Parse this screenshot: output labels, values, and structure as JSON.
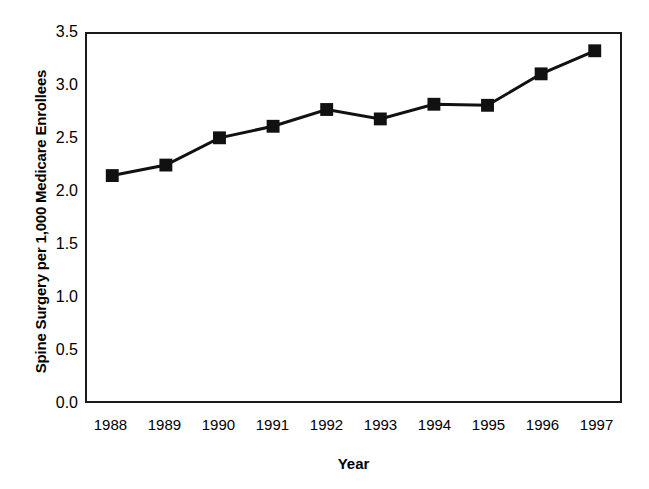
{
  "chart_data": {
    "type": "line",
    "title": "",
    "subtitle": "",
    "xlabel": "Year",
    "ylabel": "Spine Surgery per 1,000 Medicare Enrollees",
    "categories": [
      "1988",
      "1989",
      "1990",
      "1991",
      "1992",
      "1993",
      "1994",
      "1995",
      "1996",
      "1997"
    ],
    "x": [
      1988,
      1989,
      1990,
      1991,
      1992,
      1993,
      1994,
      1995,
      1996,
      1997
    ],
    "values": [
      2.15,
      2.25,
      2.51,
      2.62,
      2.78,
      2.69,
      2.83,
      2.82,
      3.12,
      3.34
    ],
    "series": [
      {
        "name": "Spine Surgery Rate",
        "values": [
          2.15,
          2.25,
          2.51,
          2.62,
          2.78,
          2.69,
          2.83,
          2.82,
          3.12,
          3.34
        ]
      }
    ],
    "ylim": [
      0.0,
      3.5
    ],
    "xlim": [
      1987.5,
      1997.5
    ],
    "y_ticks": [
      "0.0",
      "0.5",
      "1.0",
      "1.5",
      "2.0",
      "2.5",
      "3.0",
      "3.5"
    ],
    "y_tick_values": [
      0.0,
      0.5,
      1.0,
      1.5,
      2.0,
      2.5,
      3.0,
      3.5
    ],
    "x_ticks": [
      "1988",
      "1989",
      "1990",
      "1991",
      "1992",
      "1993",
      "1994",
      "1995",
      "1996",
      "1997"
    ],
    "grid": false,
    "legend": false,
    "legend_position": "none",
    "marker": "square",
    "line_color": "#111111",
    "marker_color": "#111111",
    "background_color": "#ffffff",
    "axis_color": "#1a1a1a",
    "annotations": []
  }
}
